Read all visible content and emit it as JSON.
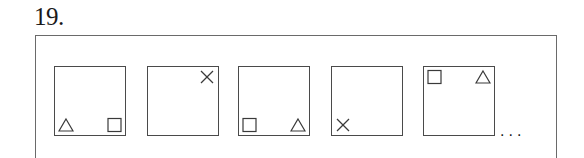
{
  "question": {
    "number": "19."
  },
  "sequence": {
    "panels": [
      {
        "index": 1,
        "shapes": [
          {
            "type": "triangle",
            "corner": "bottom-left"
          },
          {
            "type": "square",
            "corner": "bottom-right"
          }
        ]
      },
      {
        "index": 2,
        "shapes": [
          {
            "type": "cross",
            "corner": "top-right"
          }
        ]
      },
      {
        "index": 3,
        "shapes": [
          {
            "type": "square",
            "corner": "bottom-left"
          },
          {
            "type": "triangle",
            "corner": "bottom-right"
          }
        ]
      },
      {
        "index": 4,
        "shapes": [
          {
            "type": "cross",
            "corner": "bottom-left"
          }
        ]
      },
      {
        "index": 5,
        "shapes": [
          {
            "type": "square",
            "corner": "top-left"
          },
          {
            "type": "triangle",
            "corner": "top-right"
          }
        ]
      }
    ],
    "continuation": "..."
  }
}
